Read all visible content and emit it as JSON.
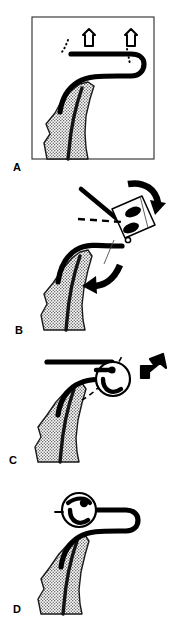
{
  "figure": {
    "width": 176,
    "height": 623,
    "background_color": "#ffffff",
    "ink_color": "#000000",
    "stipple_color": "#7a7a7a"
  },
  "panels": [
    {
      "id": "panel-a",
      "label": "A",
      "has_border": true,
      "caption": "Tube positioned in tissue with two downward compression arrows",
      "elements": {
        "arrow_count": 2,
        "arrow_direction": "down",
        "arrow_style": "outline",
        "dotted_guides": 2,
        "tissue": "stippled"
      }
    },
    {
      "id": "panel-b",
      "label": "B",
      "has_border": false,
      "caption": "Instrument engaged, rotation indicated by two solid curved arrows",
      "elements": {
        "curved_arrow_count": 2,
        "curved_arrow_direction": "clockwise",
        "instrument": "angled clamp",
        "dashed_reference_line": true,
        "tissue": "stippled"
      }
    },
    {
      "id": "panel-c",
      "label": "C",
      "has_border": false,
      "caption": "Magnified circular inset with hooked rotation arrow",
      "elements": {
        "magnifier_inset": true,
        "hook_arrow": true,
        "hook_arrow_direction": "up-left",
        "dashed_leader_line": true,
        "tissue": "stippled"
      }
    },
    {
      "id": "panel-d",
      "label": "D",
      "has_border": false,
      "caption": "Final seated position shown in magnified circular inset",
      "elements": {
        "magnifier_inset": true,
        "tick_marker": true,
        "tissue": "stippled"
      }
    }
  ],
  "labels": {
    "a": "A",
    "b": "B",
    "c": "C",
    "d": "D"
  }
}
